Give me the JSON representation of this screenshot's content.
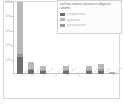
{
  "chart_data": {
    "type": "bar",
    "stacked": true,
    "title": "",
    "xlabel": "",
    "ylabel": "",
    "ylim": [
      0,
      50
    ],
    "grid": false,
    "legend_position": "top-right",
    "legend_title": "roof has serious intrusion in alligators column",
    "ytick_labels": [
      "50%",
      "40%",
      "30%",
      "20%",
      "10%"
    ],
    "ytick_values": [
      50,
      40,
      30,
      20,
      10
    ],
    "categories": [
      "heat palettes",
      "wind surface",
      "cold harbour",
      "open terrain",
      "deep valley",
      "dry ravine",
      "salt meadow",
      "north ridge",
      "mixed stand"
    ],
    "series": [
      {
        "name": "not galvanised",
        "color": "#6e6e6e",
        "values": [
          11.5,
          3.2,
          2.0,
          0.0,
          2.6,
          0.4,
          2.1,
          2.4,
          0.8
        ]
      },
      {
        "name": "galvanised",
        "color": "#b8b8b8",
        "values": [
          36.0,
          4.6,
          3.4,
          0.0,
          2.4,
          0.3,
          2.9,
          4.0,
          0.7
        ]
      },
      {
        "name": "part galvanised",
        "color": "#9a9a9a",
        "values": [
          2.5,
          0.6,
          0.5,
          0.0,
          0.5,
          0.1,
          0.6,
          0.8,
          0.2
        ]
      }
    ],
    "totals": [
      50.0,
      8.4,
      5.9,
      0.0,
      5.5,
      0.8,
      5.6,
      7.2,
      1.7
    ]
  }
}
